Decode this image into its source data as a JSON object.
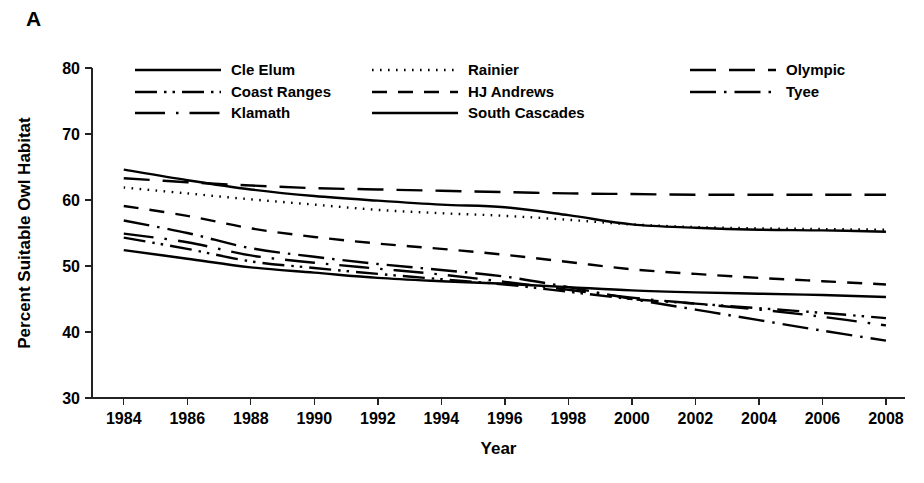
{
  "figure": {
    "panel_label": "A"
  },
  "chart_data": {
    "type": "line",
    "title": "",
    "xlabel": "Year",
    "ylabel": "Percent Suitable Owl Habitat",
    "xlim": [
      1983,
      2008.6
    ],
    "ylim": [
      30,
      80
    ],
    "grid": false,
    "legend_position": "top-inside",
    "x_ticks": [
      1984,
      1986,
      1988,
      1990,
      1992,
      1994,
      1996,
      1998,
      2000,
      2002,
      2004,
      2006,
      2008
    ],
    "x_tick_labels": [
      "1984",
      "1986",
      "1988",
      "1990",
      "1992",
      "1994",
      "1996",
      "1998",
      "2000",
      "2002",
      "2004",
      "2006",
      "2008"
    ],
    "y_ticks": [
      30,
      40,
      50,
      60,
      70,
      80
    ],
    "y_tick_labels": [
      "30",
      "40",
      "50",
      "60",
      "70",
      "80"
    ],
    "x": [
      1984,
      1986,
      1988,
      1990,
      1992,
      1994,
      1996,
      1998,
      2000,
      2002,
      2004,
      2006,
      2008
    ],
    "series": [
      {
        "name": "Cle Elum",
        "dash": "solid",
        "values": [
          64.6,
          63.0,
          61.6,
          60.6,
          59.9,
          59.3,
          58.9,
          57.7,
          56.3,
          55.8,
          55.5,
          55.4,
          55.2
        ]
      },
      {
        "name": "Coast Ranges",
        "dash": "dash-dot-dot",
        "values": [
          54.3,
          52.6,
          50.7,
          49.7,
          48.8,
          48.0,
          47.2,
          46.1,
          45.0,
          44.3,
          43.6,
          42.9,
          42.1
        ]
      },
      {
        "name": "Klamath",
        "dash": "longdash-dot",
        "values": [
          54.9,
          53.6,
          51.6,
          50.5,
          49.6,
          48.7,
          47.6,
          46.4,
          45.2,
          44.3,
          43.4,
          42.3,
          41.0
        ]
      },
      {
        "name": "Rainier",
        "dash": "dotted",
        "values": [
          61.9,
          61.0,
          60.1,
          59.3,
          58.5,
          58.0,
          57.6,
          57.0,
          56.3,
          55.9,
          55.7,
          55.6,
          55.5
        ]
      },
      {
        "name": "HJ Andrews",
        "dash": "dashed",
        "values": [
          59.1,
          57.6,
          55.7,
          54.4,
          53.4,
          52.6,
          51.7,
          50.6,
          49.5,
          48.8,
          48.2,
          47.7,
          47.2
        ]
      },
      {
        "name": "South Cascades",
        "dash": "solid",
        "values": [
          52.4,
          51.1,
          49.8,
          49.0,
          48.2,
          47.7,
          47.3,
          46.8,
          46.3,
          46.0,
          45.8,
          45.6,
          45.3
        ]
      },
      {
        "name": "Olympic",
        "dash": "longdash",
        "values": [
          63.3,
          62.7,
          62.2,
          61.8,
          61.6,
          61.4,
          61.2,
          61.0,
          60.9,
          60.8,
          60.8,
          60.8,
          60.8
        ]
      },
      {
        "name": "Tyee",
        "dash": "dash-dot",
        "values": [
          56.9,
          55.0,
          52.7,
          51.4,
          50.3,
          49.4,
          48.4,
          46.8,
          45.0,
          43.4,
          41.8,
          40.2,
          38.7
        ]
      }
    ]
  },
  "legend": {
    "entries": [
      {
        "label": "Cle Elum",
        "dash": "solid"
      },
      {
        "label": "Rainier",
        "dash": "dotted"
      },
      {
        "label": "Olympic",
        "dash": "longdash"
      },
      {
        "label": "Coast Ranges",
        "dash": "dash-dot-dot"
      },
      {
        "label": "HJ Andrews",
        "dash": "dashed"
      },
      {
        "label": "Tyee",
        "dash": "dash-dot"
      },
      {
        "label": "Klamath",
        "dash": "longdash-dot"
      },
      {
        "label": "South Cascades",
        "dash": "solid"
      }
    ]
  }
}
